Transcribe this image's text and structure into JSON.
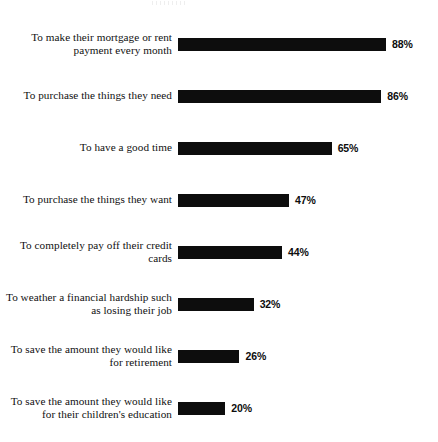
{
  "chart_data": {
    "type": "bar",
    "orientation": "horizontal",
    "title": "",
    "xlabel": "",
    "ylabel": "",
    "xlim": [
      0,
      100
    ],
    "grid": false,
    "legend": false,
    "value_suffix": "%",
    "bar_color": "#0d0d0d",
    "categories": [
      "To make their mortgage or rent payment every month",
      "To purchase the things they need",
      "To have a good time",
      "To purchase the things they want",
      "To completely pay off their credit cards",
      "To weather a financial hardship such as losing their job",
      "To save the amount they would like for retirement",
      "To save the amount they would like for their children's education"
    ],
    "values": [
      88,
      86,
      65,
      47,
      44,
      32,
      26,
      20
    ],
    "value_labels": [
      "88%",
      "86%",
      "65%",
      "47%",
      "44%",
      "32%",
      "26%",
      "20%"
    ]
  }
}
